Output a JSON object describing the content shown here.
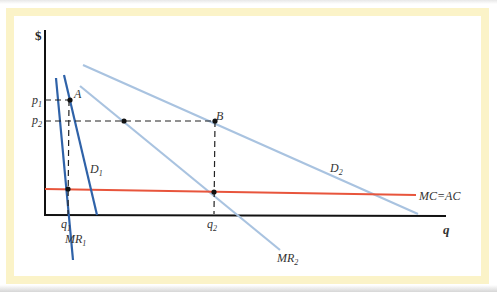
{
  "figure": {
    "y_axis_label": "$",
    "x_axis_label": "q",
    "price_labels": [
      {
        "base": "p",
        "sub": "1"
      },
      {
        "base": "p",
        "sub": "2"
      }
    ],
    "quantity_labels": [
      {
        "base": "q",
        "sub": "1"
      },
      {
        "base": "q",
        "sub": "2"
      }
    ],
    "points": [
      "A",
      "B"
    ],
    "curves": {
      "mr1": {
        "base": "MR",
        "sub": "1"
      },
      "d1": {
        "base": "D",
        "sub": "1"
      },
      "mr2": {
        "base": "MR",
        "sub": "2"
      },
      "d2": {
        "base": "D",
        "sub": "2"
      },
      "mc": "MC=AC"
    },
    "colors": {
      "frame": "#fbf3c8",
      "demand_1": "#2f62a8",
      "demand_2": "#a9c3e0",
      "cost": "#e8553c",
      "axis": "#111111"
    }
  }
}
